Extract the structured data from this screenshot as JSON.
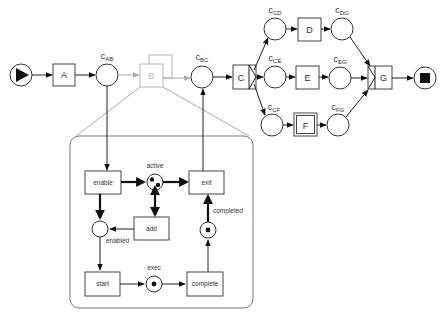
{
  "diagram": {
    "type": "workflow-net",
    "colors": {
      "stroke": "#333333",
      "ghost": "#b5b5b5",
      "token": "#111111",
      "background": "#ffffff"
    },
    "start_place": {
      "icon": "play-triangle-icon"
    },
    "end_place": {
      "icon": "stop-square-icon"
    },
    "transitions": {
      "A": {
        "label": "A"
      },
      "B": {
        "label": "B",
        "style": "faded, multi-instance (stacked)"
      },
      "C": {
        "label": "C",
        "split": "XOR-split"
      },
      "D": {
        "label": "D"
      },
      "E": {
        "label": "E"
      },
      "F": {
        "label": "F",
        "style": "double border"
      },
      "G": {
        "label": "G",
        "join": "XOR-join"
      }
    },
    "places": {
      "cAB": {
        "main": "c",
        "sub": "AB"
      },
      "cBC": {
        "main": "c",
        "sub": "BC"
      },
      "cCD": {
        "main": "c",
        "sub": "CD"
      },
      "cCE": {
        "main": "c",
        "sub": "CE"
      },
      "cCF": {
        "main": "c",
        "sub": "CF"
      },
      "cDG": {
        "main": "c",
        "sub": "DG"
      },
      "cEG": {
        "main": "c",
        "sub": "EG"
      },
      "cFG": {
        "main": "c",
        "sub": "FG"
      }
    },
    "subnet": {
      "transitions": {
        "enable": "enable",
        "exit": "exit",
        "add": "add",
        "start": "start",
        "complete": "complete"
      },
      "places": {
        "active": {
          "label": "active",
          "tokens": 2
        },
        "enabled": {
          "label": "enabled",
          "tokens": 0
        },
        "exec": {
          "label": "exec",
          "tokens": 1
        },
        "completed": {
          "label": "completed",
          "tokens": 1
        }
      }
    }
  }
}
